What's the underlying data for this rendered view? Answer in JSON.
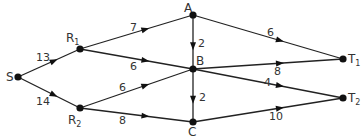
{
  "diagram": {
    "type": "directed-network",
    "nodes": [
      {
        "id": "S",
        "label": "S",
        "sub": "",
        "x": 18,
        "y": 77,
        "lx": 6,
        "ly": 81
      },
      {
        "id": "R1",
        "label": "R",
        "sub": "1",
        "x": 80,
        "y": 49,
        "lx": 66,
        "ly": 42
      },
      {
        "id": "R2",
        "label": "R",
        "sub": "2",
        "x": 80,
        "y": 108,
        "lx": 68,
        "ly": 124
      },
      {
        "id": "A",
        "label": "A",
        "sub": "",
        "x": 193,
        "y": 15,
        "lx": 184,
        "ly": 12
      },
      {
        "id": "B",
        "label": "B",
        "sub": "",
        "x": 193,
        "y": 69,
        "lx": 196,
        "ly": 65
      },
      {
        "id": "C",
        "label": "C",
        "sub": "",
        "x": 193,
        "y": 122,
        "lx": 188,
        "ly": 136
      },
      {
        "id": "T1",
        "label": "T",
        "sub": "1",
        "x": 343,
        "y": 59,
        "lx": 348,
        "ly": 63
      },
      {
        "id": "T2",
        "label": "T",
        "sub": "2",
        "x": 343,
        "y": 98,
        "lx": 348,
        "ly": 102
      }
    ],
    "edges": [
      {
        "from": "S",
        "to": "R1",
        "weight": "13",
        "lx": 36,
        "ly": 61
      },
      {
        "from": "S",
        "to": "R2",
        "weight": "14",
        "lx": 36,
        "ly": 105
      },
      {
        "from": "R1",
        "to": "A",
        "weight": "7",
        "lx": 130,
        "ly": 31
      },
      {
        "from": "R1",
        "to": "B",
        "weight": "6",
        "lx": 130,
        "ly": 70
      },
      {
        "from": "R2",
        "to": "B",
        "weight": "6",
        "lx": 119,
        "ly": 91
      },
      {
        "from": "R2",
        "to": "C",
        "weight": "8",
        "lx": 119,
        "ly": 124
      },
      {
        "from": "A",
        "to": "B",
        "weight": "2",
        "lx": 198,
        "ly": 47
      },
      {
        "from": "A",
        "to": "T1",
        "weight": "6",
        "lx": 267,
        "ly": 36
      },
      {
        "from": "B",
        "to": "T1",
        "weight": "8",
        "lx": 274,
        "ly": 75
      },
      {
        "from": "B",
        "to": "T2",
        "weight": "4",
        "lx": 264,
        "ly": 86
      },
      {
        "from": "B",
        "to": "C",
        "weight": "2",
        "lx": 199,
        "ly": 101
      },
      {
        "from": "C",
        "to": "T2",
        "weight": "10",
        "lx": 269,
        "ly": 120
      }
    ],
    "colors": {
      "line": "#222222",
      "node": "#111111",
      "text": "#333333"
    }
  }
}
